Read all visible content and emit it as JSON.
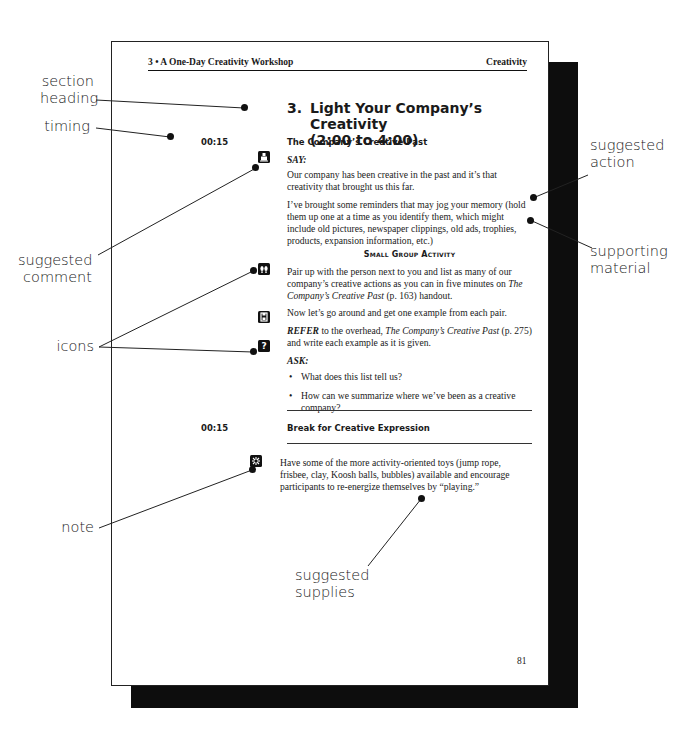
{
  "header": {
    "chapter": "3 • A One-Day Creativity Workshop",
    "section_tag": "Creativity"
  },
  "section": {
    "number": "3.",
    "title_line1": "Light Your Company’s Creativity",
    "title_line2": "(2:00 to 4:00)"
  },
  "block1": {
    "timing": "00:15",
    "subheading": "The Company’s Creative Past",
    "say_cue": "SAY:",
    "para1": "Our company has been creative in the past and it’s that creativity that brought us this far.",
    "para2": "I’ve brought some reminders that may jog your memory (hold them up one at a time as you identify them, which might include old pictures, newspaper clippings, old ads, trophies, products, expansion information, etc.)",
    "activity_heading": "Small Group Activity",
    "para3_pre": "Pair up with the person next to you and list as many of our company’s creative actions as you can in five minutes on ",
    "para3_title": "The Company’s Creative Past",
    "para3_post": " (p. 163) handout.",
    "para4": "Now let’s go around and get one example from each pair.",
    "refer_cue": "REFER",
    "refer_mid": " to the overhead, ",
    "refer_title": "The Company’s Creative Past",
    "refer_post": " (p. 275) and write each example as it is given.",
    "ask_cue": "ASK:",
    "questions": [
      "What does this list tell us?",
      "How can we summarize where we’ve been as a creative company?"
    ]
  },
  "block2": {
    "timing": "00:15",
    "subheading": "Break for Creative Expression",
    "para": "Have some of the more activity-oriented toys (jump rope, frisbee, clay, Koosh balls, bubbles) available and encourage participants to re-energize themselves by “playing.”"
  },
  "page_number": "81",
  "icons": {
    "say": "speaker-icon",
    "activity": "footprints-icon",
    "overhead": "projector-icon",
    "ask": "question-icon",
    "note": "snowflake-note-icon",
    "ask_glyph": "?"
  },
  "annotations": {
    "section_heading": [
      "section",
      "heading"
    ],
    "timing": [
      "timing"
    ],
    "suggested_comment": [
      "suggested",
      "comment"
    ],
    "icons": [
      "icons"
    ],
    "note": [
      "note"
    ],
    "suggested_action": [
      "suggested",
      "action"
    ],
    "supporting_material": [
      "supporting",
      "material"
    ],
    "suggested_supplies": [
      "suggested",
      "supplies"
    ]
  },
  "colors": {
    "ink": "#111111",
    "page": "#ffffff",
    "shadow": "#0d0d0d"
  }
}
